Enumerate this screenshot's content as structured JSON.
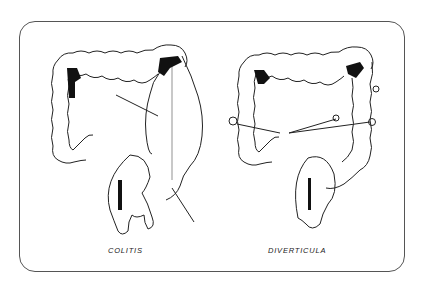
{
  "figure": {
    "panels": [
      {
        "label": "COLITIS",
        "subject": "colon-with-colitis",
        "arrows": 2
      },
      {
        "label": "DIVERTICULA",
        "subject": "colon-with-diverticula",
        "arrows": 3
      }
    ],
    "colors": {
      "line": "#222222",
      "shade": "#111111",
      "background": "#ffffff",
      "border": "#555555"
    }
  }
}
